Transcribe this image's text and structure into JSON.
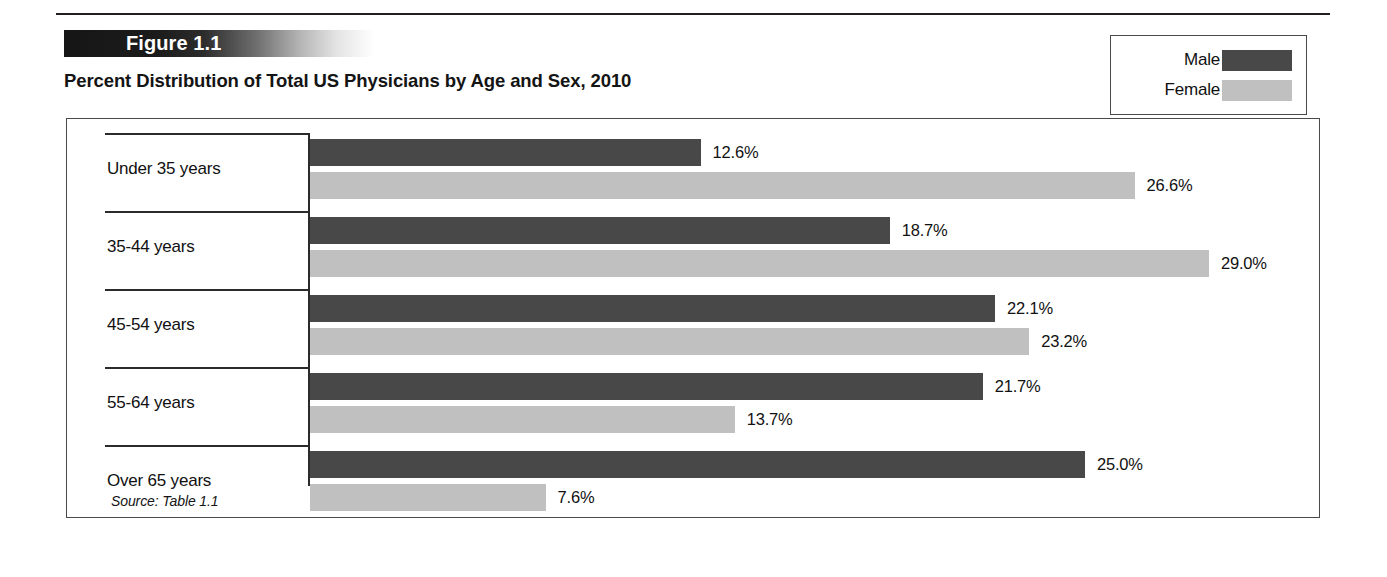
{
  "figure": {
    "banner_label": "Figure 1.1",
    "title": "Percent Distribution of Total US Physicians by Age and Sex, 2010",
    "source_note": "Source: Table 1.1"
  },
  "legend": {
    "items": [
      {
        "label": "Male",
        "color": "#484848"
      },
      {
        "label": "Female",
        "color": "#c0c0c0"
      }
    ]
  },
  "chart_data": {
    "type": "bar",
    "orientation": "horizontal",
    "title": "Percent Distribution of Total US Physicians by Age and Sex, 2010",
    "xlabel": "",
    "ylabel": "",
    "grid": false,
    "legend_position": "top-right",
    "xlim": [
      0,
      29.0
    ],
    "categories": [
      "Under 35 years",
      "35-44 years",
      "45-54 years",
      "55-64 years",
      "Over 65 years"
    ],
    "series": [
      {
        "name": "Male",
        "color": "#484848",
        "values": [
          12.6,
          18.7,
          22.1,
          21.7,
          25.0
        ],
        "labels": [
          "12.6%",
          "18.7%",
          "22.1%",
          "21.7%",
          "25.0%"
        ]
      },
      {
        "name": "Female",
        "color": "#c0c0c0",
        "values": [
          26.6,
          29.0,
          23.2,
          13.7,
          7.6
        ],
        "labels": [
          "26.6%",
          "29.0%",
          "23.2%",
          "13.7%",
          "7.6%"
        ]
      }
    ],
    "units": "percent",
    "px_per_unit": 31.0
  }
}
